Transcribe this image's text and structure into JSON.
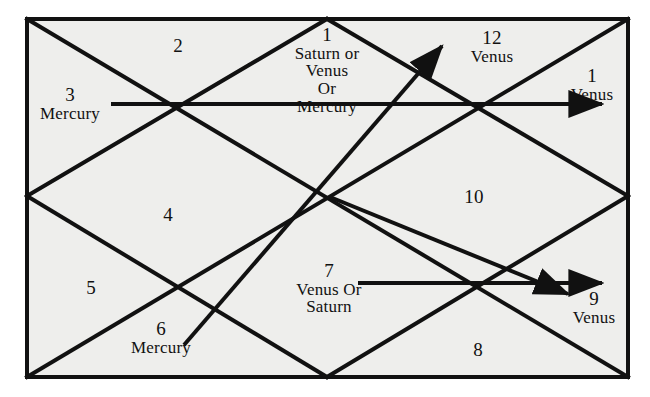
{
  "figure": {
    "kind": "north-indian-astrological-chart",
    "background_color": "#ffffff",
    "field_color": "#eeeeec",
    "line_color": "#111111"
  },
  "houses": [
    {
      "id": "house-1-top",
      "number": "1",
      "lines": [
        "Saturn or",
        "Venus",
        "Or",
        "Mercury"
      ],
      "x": 327,
      "y": 70
    },
    {
      "id": "house-2",
      "number": "2",
      "lines": [],
      "x": 178,
      "y": 46
    },
    {
      "id": "house-3",
      "number": "3",
      "lines": [
        "Mercury"
      ],
      "x": 70,
      "y": 104
    },
    {
      "id": "house-12",
      "number": "12",
      "lines": [
        "Venus"
      ],
      "x": 492,
      "y": 47
    },
    {
      "id": "house-1-right",
      "number": "1",
      "lines": [
        "Venus"
      ],
      "x": 592,
      "y": 85
    },
    {
      "id": "house-10",
      "number": "10",
      "lines": [],
      "x": 474,
      "y": 197
    },
    {
      "id": "house-4",
      "number": "4",
      "lines": [],
      "x": 168,
      "y": 215
    },
    {
      "id": "house-5",
      "number": "5",
      "lines": [],
      "x": 91,
      "y": 288
    },
    {
      "id": "house-6",
      "number": "6",
      "lines": [
        "Mercury"
      ],
      "x": 161,
      "y": 338
    },
    {
      "id": "house-7",
      "number": "7",
      "lines": [
        "Venus Or",
        "Saturn"
      ],
      "x": 329,
      "y": 289
    },
    {
      "id": "house-8",
      "number": "8",
      "lines": [],
      "x": 478,
      "y": 350
    },
    {
      "id": "house-9",
      "number": "9",
      "lines": [
        "Venus"
      ],
      "x": 594,
      "y": 308
    }
  ],
  "chart_data": {
    "type": "diagram",
    "title": "",
    "frame": {
      "x1": 27,
      "y1": 19,
      "x2": 628,
      "y2": 377
    },
    "vertices": {
      "top_mid": [
        327,
        19
      ],
      "bottom_mid": [
        327,
        377
      ],
      "left_mid": [
        27,
        196
      ],
      "right_mid": [
        628,
        196
      ]
    },
    "diamond_edges": [
      [
        [
          327,
          19
        ],
        [
          628,
          196
        ]
      ],
      [
        [
          628,
          196
        ],
        [
          327,
          377
        ]
      ],
      [
        [
          327,
          377
        ],
        [
          27,
          196
        ]
      ],
      [
        [
          27,
          196
        ],
        [
          327,
          19
        ]
      ]
    ],
    "corner_diagonals": [
      [
        [
          27,
          19
        ],
        [
          327,
          196
        ]
      ],
      [
        [
          327,
          196
        ],
        [
          628,
          19
        ]
      ],
      [
        [
          27,
          377
        ],
        [
          327,
          196
        ]
      ],
      [
        [
          327,
          196
        ],
        [
          628,
          377
        ]
      ]
    ],
    "arrows": [
      {
        "name": "mercury-horizontal-arrow",
        "from": [
          111,
          104
        ],
        "to": [
          608,
          104
        ],
        "label_start": "3 Mercury",
        "label_end": "1 Venus"
      },
      {
        "name": "mercury-diagonal-arrow",
        "from": [
          184,
          345
        ],
        "to": [
          446,
          42
        ],
        "label_start": "6 Mercury",
        "label_end": "12 Venus"
      },
      {
        "name": "venus-saturn-horizontal-arrow",
        "from": [
          358,
          283
        ],
        "to": [
          608,
          283
        ],
        "label_start": "7 Venus Or Saturn",
        "label_end": "9 Venus"
      },
      {
        "name": "venus-saturn-diagonal-arrow",
        "from": [
          327,
          196
        ],
        "to": [
          573,
          296
        ],
        "label_start": "",
        "label_end": "9 Venus"
      }
    ],
    "axis_ranges": {
      "x": [
        0,
        650
      ],
      "y": [
        0,
        397
      ]
    },
    "grid": false,
    "legend": null
  }
}
